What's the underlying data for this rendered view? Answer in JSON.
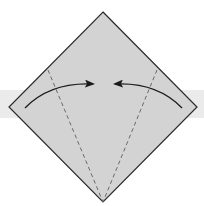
{
  "diagram": {
    "type": "origami-fold-instruction",
    "colors": {
      "background": "#ffffff",
      "band": "#ebebeb",
      "paper_fill": "#d3d3d3",
      "outline": "#2a2a2a",
      "fold_line": "#6a6a6a",
      "arrow": "#1a1a1a"
    },
    "band": {
      "y": 90,
      "height": 28
    },
    "paper": {
      "shape": "diamond",
      "vertices": {
        "top": [
          103,
          12
        ],
        "right": [
          197,
          107
        ],
        "bottom": [
          103,
          202
        ],
        "left": [
          9,
          107
        ]
      }
    },
    "fold_lines": [
      {
        "name": "left-valley-fold",
        "from": [
          48,
          70
        ],
        "to": [
          103,
          202
        ],
        "style": "dashed"
      },
      {
        "name": "right-valley-fold",
        "from": [
          157,
          70
        ],
        "to": [
          103,
          202
        ],
        "style": "dashed"
      }
    ],
    "arrows": [
      {
        "name": "left-fold-arrow",
        "direction": "right",
        "from": [
          25,
          108
        ],
        "control": [
          50,
          82
        ],
        "to": [
          93,
          84
        ]
      },
      {
        "name": "right-fold-arrow",
        "direction": "left",
        "from": [
          182,
          108
        ],
        "control": [
          157,
          82
        ],
        "to": [
          115,
          84
        ]
      }
    ]
  }
}
